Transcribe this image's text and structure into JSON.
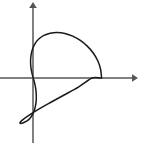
{
  "figure": {
    "title": "",
    "background_color": "#ffffff",
    "width": 143,
    "height": 143
  },
  "axes": {
    "x_axis": {
      "label": "",
      "color": "#808080",
      "arrow": "right-arrowhead",
      "start_px": 0,
      "end_px": 137,
      "y_px": 78
    },
    "y_axis": {
      "label": "",
      "color": "#808080",
      "arrow": "up-arrowhead",
      "start_px": 143,
      "end_px": 2,
      "x_px": 33
    },
    "origin_px": {
      "x": 33,
      "y": 78
    },
    "tick_labels": []
  },
  "chart_data": {
    "type": "line",
    "title": "",
    "subtitle": "",
    "xlabel": "",
    "ylabel": "",
    "curve_name": "cardioid",
    "polar_equation": "r = a(1 + cos(theta))",
    "parameter_a": 34,
    "cusp_point": {
      "x": 0,
      "y": 0
    },
    "rightmost_point": {
      "x": 68,
      "y": 0
    },
    "topmost_point": {
      "x": 25.5,
      "y": 44.2
    },
    "bottommost_point": {
      "x": 25.5,
      "y": -44.2
    },
    "leftmost_point": {
      "x": -12.75,
      "y": 22.1
    },
    "orientation": "opens right, cusp at origin",
    "grid": false,
    "legend": "none",
    "xlim": [
      -40,
      120
    ],
    "ylim": [
      -65,
      80
    ],
    "stroke_color": "#1a1a1a",
    "x": [
      68.0,
      67.0,
      64.2,
      59.7,
      53.8,
      46.9,
      39.4,
      31.6,
      24.1,
      17.0,
      10.8,
      5.7,
      1.9,
      -0.6,
      -2.0,
      -2.4,
      -2.0,
      -1.0,
      0.2,
      1.5,
      2.6,
      3.2,
      3.2,
      2.3,
      0.6,
      -2.0,
      -5.5,
      -9.6,
      -12.3,
      -12.8,
      -10.3,
      -4.5,
      4.5,
      16.4,
      30.4,
      45.4,
      58.5,
      66.2,
      68.0
    ],
    "y": [
      0.0,
      8.7,
      17.1,
      24.8,
      31.6,
      37.3,
      41.5,
      44.1,
      45.1,
      44.4,
      42.2,
      38.6,
      33.9,
      28.3,
      22.2,
      16.0,
      10.0,
      4.6,
      0.0,
      -4.6,
      -10.0,
      -16.0,
      -22.2,
      -28.3,
      -33.9,
      -38.6,
      -42.2,
      -44.4,
      -45.1,
      -44.1,
      -41.5,
      -37.3,
      -31.6,
      -24.8,
      -17.1,
      -8.7,
      0.0,
      0.0,
      0.0
    ]
  },
  "annotations": []
}
